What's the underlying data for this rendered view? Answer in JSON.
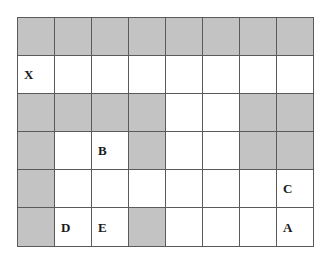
{
  "figure": {
    "type": "grid-maze",
    "rows": 6,
    "columns": 8,
    "colors": {
      "shaded_cell": "#c3c3c3",
      "open_cell": "#ffffff",
      "grid_line": "#5a5a5a",
      "label_text": "#1a1a1a",
      "background": "#ffffff"
    },
    "cells": [
      [
        {
          "shaded": true,
          "label": ""
        },
        {
          "shaded": true,
          "label": ""
        },
        {
          "shaded": true,
          "label": ""
        },
        {
          "shaded": true,
          "label": ""
        },
        {
          "shaded": true,
          "label": ""
        },
        {
          "shaded": true,
          "label": ""
        },
        {
          "shaded": true,
          "label": ""
        },
        {
          "shaded": true,
          "label": ""
        }
      ],
      [
        {
          "shaded": false,
          "label": "X"
        },
        {
          "shaded": false,
          "label": ""
        },
        {
          "shaded": false,
          "label": ""
        },
        {
          "shaded": false,
          "label": ""
        },
        {
          "shaded": false,
          "label": ""
        },
        {
          "shaded": false,
          "label": ""
        },
        {
          "shaded": false,
          "label": ""
        },
        {
          "shaded": false,
          "label": ""
        }
      ],
      [
        {
          "shaded": true,
          "label": ""
        },
        {
          "shaded": true,
          "label": ""
        },
        {
          "shaded": true,
          "label": ""
        },
        {
          "shaded": true,
          "label": ""
        },
        {
          "shaded": false,
          "label": ""
        },
        {
          "shaded": false,
          "label": ""
        },
        {
          "shaded": true,
          "label": ""
        },
        {
          "shaded": true,
          "label": ""
        }
      ],
      [
        {
          "shaded": true,
          "label": ""
        },
        {
          "shaded": false,
          "label": ""
        },
        {
          "shaded": false,
          "label": "B"
        },
        {
          "shaded": true,
          "label": ""
        },
        {
          "shaded": false,
          "label": ""
        },
        {
          "shaded": false,
          "label": ""
        },
        {
          "shaded": true,
          "label": ""
        },
        {
          "shaded": true,
          "label": ""
        }
      ],
      [
        {
          "shaded": true,
          "label": ""
        },
        {
          "shaded": false,
          "label": ""
        },
        {
          "shaded": false,
          "label": ""
        },
        {
          "shaded": false,
          "label": ""
        },
        {
          "shaded": false,
          "label": ""
        },
        {
          "shaded": false,
          "label": ""
        },
        {
          "shaded": false,
          "label": ""
        },
        {
          "shaded": false,
          "label": "C"
        }
      ],
      [
        {
          "shaded": true,
          "label": ""
        },
        {
          "shaded": false,
          "label": "D"
        },
        {
          "shaded": false,
          "label": "E"
        },
        {
          "shaded": true,
          "label": ""
        },
        {
          "shaded": false,
          "label": ""
        },
        {
          "shaded": false,
          "label": ""
        },
        {
          "shaded": false,
          "label": ""
        },
        {
          "shaded": false,
          "label": "A"
        }
      ]
    ]
  }
}
